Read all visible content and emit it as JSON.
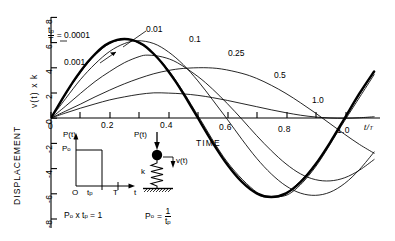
{
  "axes": {
    "y_title_outer": "DISPLACEMENT",
    "y_title_inner": "v(t) x k",
    "x_title": "TIME",
    "x_axis_symbol_num": "t",
    "x_axis_symbol_den": "T",
    "y_ticks": [
      "8",
      "6",
      "4",
      "2",
      "0",
      "-2",
      "-4",
      "-6",
      "-8"
    ],
    "y_tick_values": [
      8,
      6,
      4,
      2,
      0,
      -2,
      -4,
      -6,
      -8
    ],
    "x_ticks": [
      "0",
      "0.2",
      "0.4",
      "0.6",
      "0.8",
      "1.0"
    ],
    "x_tick_values": [
      0,
      0.2,
      0.4,
      0.6,
      0.8,
      1.0
    ]
  },
  "annotations": {
    "ratio_symbol_num": "t",
    "ratio_symbol_num_sub": "p",
    "ratio_symbol_den": "T",
    "ratio_equals": "= 0.0001",
    "leader_0001": "0.001",
    "leader_001": "0.01"
  },
  "pulse_diagram": {
    "y_axis_label": "P(t)",
    "level_label": "P",
    "level_sub": "o",
    "origin_label": "O",
    "tp_label": "t",
    "tp_sub": "p",
    "T_label": "T",
    "t_label": "t"
  },
  "oscillator_diagram": {
    "force_label": "P(t)",
    "spring_label": "k",
    "displacement_label": "v(t)"
  },
  "equations": {
    "left_p": "P",
    "left_p_sub": "o",
    "left_rest": "x t",
    "left_rest_sub": "p",
    "left_tail": "= 1",
    "right_p": "P",
    "right_p_sub": "o",
    "right_eq": "=",
    "right_num": "1",
    "right_den": "t",
    "right_den_sub": "p"
  },
  "colors": {
    "ink": "#000000",
    "curve_thin": "#1a1a1a",
    "background": "#ffffff"
  },
  "chart_data": {
    "type": "line",
    "title": "",
    "xlabel": "TIME  t/T",
    "ylabel": "DISPLACEMENT  v(t) x k",
    "xlim": [
      0,
      1.12
    ],
    "ylim": [
      -8,
      8
    ],
    "grid": false,
    "legend": "inline curve labels",
    "note": "Response of an undamped SDOF oscillator to a rectangular load pulse of duration t_p and amplitude P_o, with P_o * t_p = 1 (unit impulse). Curves are labelled by the duration ratio t_p/T.",
    "series": [
      {
        "name": "0.0001",
        "label": "t_p/T = 0.0001",
        "emphasis": "heavy",
        "peak_value": 6.3,
        "peak_x": 0.25,
        "points": [
          [
            0.0,
            0.0
          ],
          [
            0.025,
            0.99
          ],
          [
            0.05,
            1.95
          ],
          [
            0.075,
            2.87
          ],
          [
            0.1,
            3.7
          ],
          [
            0.125,
            4.45
          ],
          [
            0.15,
            5.09
          ],
          [
            0.175,
            5.63
          ],
          [
            0.2,
            5.99
          ],
          [
            0.225,
            6.21
          ],
          [
            0.25,
            6.28
          ],
          [
            0.275,
            6.21
          ],
          [
            0.3,
            5.99
          ],
          [
            0.325,
            5.63
          ],
          [
            0.35,
            5.09
          ],
          [
            0.375,
            4.45
          ],
          [
            0.4,
            3.7
          ],
          [
            0.425,
            2.87
          ],
          [
            0.45,
            1.95
          ],
          [
            0.475,
            0.99
          ],
          [
            0.5,
            0.0
          ],
          [
            0.55,
            -1.95
          ],
          [
            0.6,
            -3.7
          ],
          [
            0.65,
            -5.09
          ],
          [
            0.7,
            -5.99
          ],
          [
            0.75,
            -6.28
          ],
          [
            0.8,
            -5.99
          ],
          [
            0.85,
            -5.09
          ],
          [
            0.9,
            -3.7
          ],
          [
            0.95,
            -1.95
          ],
          [
            1.0,
            0.0
          ],
          [
            1.05,
            1.95
          ],
          [
            1.1,
            3.7
          ]
        ]
      },
      {
        "name": "0.001",
        "label": "t_p/T = 0.001",
        "emphasis": "normal",
        "peak_value": 6.28,
        "peak_x": 0.25,
        "points": [
          [
            0.0,
            0.0
          ],
          [
            0.05,
            1.95
          ],
          [
            0.1,
            3.7
          ],
          [
            0.15,
            5.09
          ],
          [
            0.2,
            5.99
          ],
          [
            0.25,
            6.28
          ],
          [
            0.3,
            5.99
          ],
          [
            0.35,
            5.09
          ],
          [
            0.4,
            3.7
          ],
          [
            0.45,
            1.95
          ],
          [
            0.5,
            0.0
          ],
          [
            0.6,
            -3.7
          ],
          [
            0.7,
            -5.99
          ],
          [
            0.75,
            -6.28
          ],
          [
            0.8,
            -5.99
          ],
          [
            0.9,
            -3.7
          ],
          [
            1.0,
            0.0
          ],
          [
            1.1,
            3.7
          ]
        ]
      },
      {
        "name": "0.01",
        "label": "t_p/T = 0.01",
        "emphasis": "normal",
        "peak_value": 6.25,
        "peak_x": 0.255,
        "points": [
          [
            0.0,
            0.0
          ],
          [
            0.05,
            1.9
          ],
          [
            0.1,
            3.62
          ],
          [
            0.15,
            5.0
          ],
          [
            0.2,
            5.92
          ],
          [
            0.255,
            6.25
          ],
          [
            0.3,
            5.96
          ],
          [
            0.35,
            5.12
          ],
          [
            0.4,
            3.8
          ],
          [
            0.45,
            2.1
          ],
          [
            0.5,
            0.2
          ],
          [
            0.6,
            -3.5
          ],
          [
            0.7,
            -5.9
          ],
          [
            0.76,
            -6.25
          ],
          [
            0.82,
            -5.9
          ],
          [
            0.9,
            -3.9
          ],
          [
            1.0,
            -0.2
          ],
          [
            1.1,
            3.45
          ]
        ]
      },
      {
        "name": "0.1",
        "label": "t_p/T = 0.1",
        "emphasis": "normal",
        "peak_value": 6.15,
        "peak_x": 0.295,
        "points": [
          [
            0.0,
            0.0
          ],
          [
            0.05,
            1.55
          ],
          [
            0.1,
            3.05
          ],
          [
            0.15,
            4.3
          ],
          [
            0.2,
            5.3
          ],
          [
            0.25,
            5.92
          ],
          [
            0.295,
            6.15
          ],
          [
            0.35,
            5.92
          ],
          [
            0.4,
            5.25
          ],
          [
            0.45,
            4.25
          ],
          [
            0.5,
            2.95
          ],
          [
            0.55,
            1.45
          ],
          [
            0.6,
            -0.1
          ],
          [
            0.65,
            -1.7
          ],
          [
            0.7,
            -3.2
          ],
          [
            0.75,
            -4.45
          ],
          [
            0.8,
            -5.4
          ],
          [
            0.85,
            -5.98
          ],
          [
            0.9,
            -6.15
          ],
          [
            0.95,
            -5.9
          ],
          [
            1.0,
            -5.2
          ],
          [
            1.05,
            -4.1
          ],
          [
            1.1,
            -2.7
          ]
        ]
      },
      {
        "name": "0.25",
        "label": "t_p/T = 0.25",
        "emphasis": "normal",
        "peak_value": 5.0,
        "peak_x": 0.33,
        "points": [
          [
            0.0,
            0.0
          ],
          [
            0.05,
            0.95
          ],
          [
            0.1,
            1.95
          ],
          [
            0.15,
            2.9
          ],
          [
            0.2,
            3.7
          ],
          [
            0.25,
            4.4
          ],
          [
            0.3,
            4.88
          ],
          [
            0.33,
            5.0
          ],
          [
            0.38,
            4.85
          ],
          [
            0.43,
            4.4
          ],
          [
            0.5,
            3.3
          ],
          [
            0.55,
            2.3
          ],
          [
            0.6,
            1.15
          ],
          [
            0.65,
            -0.1
          ],
          [
            0.7,
            -1.4
          ],
          [
            0.75,
            -2.6
          ],
          [
            0.8,
            -3.65
          ],
          [
            0.85,
            -4.45
          ],
          [
            0.9,
            -4.9
          ],
          [
            0.95,
            -5.0
          ],
          [
            1.0,
            -4.75
          ],
          [
            1.05,
            -4.15
          ],
          [
            1.1,
            -3.3
          ]
        ]
      },
      {
        "name": "0.5",
        "label": "t_p/T = 0.5",
        "emphasis": "normal",
        "peak_value": 4.0,
        "peak_x": 0.52,
        "points": [
          [
            0.0,
            0.0
          ],
          [
            0.05,
            0.55
          ],
          [
            0.1,
            1.1
          ],
          [
            0.15,
            1.68
          ],
          [
            0.2,
            2.22
          ],
          [
            0.25,
            2.72
          ],
          [
            0.3,
            3.15
          ],
          [
            0.35,
            3.52
          ],
          [
            0.4,
            3.78
          ],
          [
            0.45,
            3.94
          ],
          [
            0.52,
            4.0
          ],
          [
            0.58,
            3.9
          ],
          [
            0.65,
            3.55
          ],
          [
            0.7,
            3.15
          ],
          [
            0.75,
            2.6
          ],
          [
            0.8,
            1.95
          ],
          [
            0.85,
            1.2
          ],
          [
            0.9,
            0.4
          ],
          [
            0.95,
            -0.45
          ],
          [
            1.0,
            -1.3
          ],
          [
            1.05,
            -2.1
          ],
          [
            1.1,
            -2.8
          ]
        ]
      },
      {
        "name": "1.0",
        "label": "t_p/T = 1.0",
        "emphasis": "normal",
        "peak_value": 2.0,
        "peak_x": 0.35,
        "points": [
          [
            0.0,
            0.0
          ],
          [
            0.05,
            0.4
          ],
          [
            0.1,
            0.78
          ],
          [
            0.15,
            1.12
          ],
          [
            0.2,
            1.44
          ],
          [
            0.25,
            1.68
          ],
          [
            0.3,
            1.88
          ],
          [
            0.35,
            2.0
          ],
          [
            0.4,
            1.98
          ],
          [
            0.45,
            1.92
          ],
          [
            0.5,
            1.8
          ],
          [
            0.55,
            1.62
          ],
          [
            0.6,
            1.4
          ],
          [
            0.65,
            1.15
          ],
          [
            0.7,
            0.9
          ],
          [
            0.75,
            0.65
          ],
          [
            0.8,
            0.42
          ],
          [
            0.85,
            0.22
          ],
          [
            0.9,
            0.08
          ],
          [
            0.95,
            0.0
          ],
          [
            1.0,
            -0.02
          ],
          [
            1.05,
            0.02
          ],
          [
            1.1,
            0.1
          ]
        ]
      }
    ],
    "curve_labels": [
      {
        "text": "0.01",
        "x": 0.205,
        "y": 7.25
      },
      {
        "text": "0.1",
        "x": 0.335,
        "y": 6.85
      },
      {
        "text": "0.25",
        "x": 0.5,
        "y": 5.55
      },
      {
        "text": "0.5",
        "x": 0.665,
        "y": 4.05
      },
      {
        "text": "1.0",
        "x": 0.805,
        "y": 1.75
      }
    ]
  }
}
